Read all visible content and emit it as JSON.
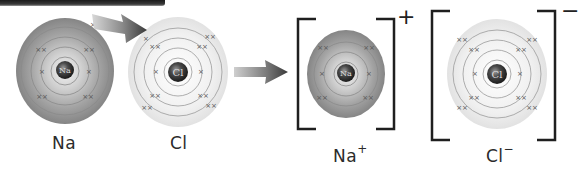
{
  "diagram": {
    "type": "ionic-bond-formation",
    "atoms": [
      {
        "id": "na-atom",
        "symbol": "Na",
        "label": "Na",
        "charge": "",
        "shells": [
          2,
          8,
          1
        ],
        "fill": "#8f8f8f"
      },
      {
        "id": "cl-atom",
        "symbol": "Cl",
        "label": "Cl",
        "charge": "",
        "shells": [
          2,
          8,
          7
        ],
        "fill": "#e8e8e8"
      }
    ],
    "ions": [
      {
        "id": "na-ion",
        "symbol": "Na",
        "label": "Na",
        "charge": "+",
        "shells": [
          2,
          8
        ],
        "fill": "#8f8f8f"
      },
      {
        "id": "cl-ion",
        "symbol": "Cl",
        "label": "Cl",
        "charge": "−",
        "shells": [
          2,
          8,
          8
        ],
        "fill": "#e8e8e8"
      }
    ],
    "arrows": [
      {
        "id": "electron-transfer-arrow",
        "from": "na-atom",
        "to": "cl-atom"
      },
      {
        "id": "reaction-arrow",
        "from": "atoms",
        "to": "ions"
      }
    ],
    "colors": {
      "nucleus": "#3a3a3a",
      "dark_sphere": "#8f8f8f",
      "light_sphere": "#ececec",
      "orbit": "#8a8a8a",
      "electron": "#555555",
      "bracket": "#1f1f1f",
      "arrow": "#3c3c3c"
    }
  }
}
